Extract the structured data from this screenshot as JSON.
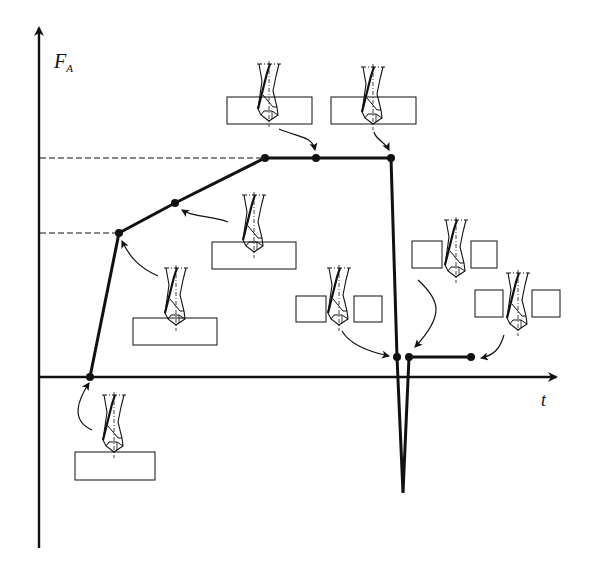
{
  "diagram": {
    "y_axis": {
      "label_main": "F",
      "label_sub": "A"
    },
    "x_axis": {
      "label": "t"
    },
    "colors": {
      "line": "#111111",
      "background": "#ffffff"
    },
    "curve_points_px": [
      [
        90,
        377
      ],
      [
        119,
        233
      ],
      [
        175,
        203
      ],
      [
        265,
        158
      ],
      [
        316,
        158
      ],
      [
        391,
        158
      ],
      [
        398,
        357
      ],
      [
        403,
        493
      ],
      [
        409,
        357
      ],
      [
        471,
        357
      ]
    ],
    "stages": [
      {
        "id": "entry-start",
        "description": "Drill tip touches workpiece surface"
      },
      {
        "id": "cone-engaged",
        "description": "Drill point cone fully engaged"
      },
      {
        "id": "lips-cutting",
        "description": "Cutting lips entering material"
      },
      {
        "id": "full-diameter",
        "description": "Full diameter engaged, steady force"
      },
      {
        "id": "steady-drilling",
        "description": "Steady-state drilling"
      },
      {
        "id": "breakthrough-start",
        "description": "Drill tip begins to exit the workpiece"
      },
      {
        "id": "exit-spike",
        "description": "Force drop / negative spike at breakthrough"
      },
      {
        "id": "through-hole",
        "description": "Drill point exited, friction only"
      },
      {
        "id": "fully-through",
        "description": "Drill passed completely through"
      }
    ]
  }
}
